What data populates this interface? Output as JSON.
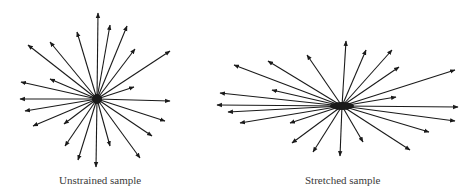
{
  "figure": {
    "panels": [
      {
        "id": "unstrained",
        "caption": "Unstrained sample",
        "center": [
          97,
          99
        ],
        "center_blob": {
          "rx": 5,
          "ry": 5
        },
        "arrows": [
          [
            98,
            13
          ],
          [
            110,
            25
          ],
          [
            127,
            26
          ],
          [
            77,
            32
          ],
          [
            50,
            42
          ],
          [
            135,
            49
          ],
          [
            28,
            45
          ],
          [
            170,
            51
          ],
          [
            21,
            82
          ],
          [
            50,
            79
          ],
          [
            134,
            87
          ],
          [
            20,
            99
          ],
          [
            170,
            101
          ],
          [
            25,
            111
          ],
          [
            33,
            126
          ],
          [
            64,
            124
          ],
          [
            165,
            121
          ],
          [
            152,
            136
          ],
          [
            65,
            146
          ],
          [
            78,
            160
          ],
          [
            96,
            167
          ],
          [
            110,
            146
          ],
          [
            140,
            158
          ]
        ]
      },
      {
        "id": "stretched",
        "caption": "Stretched sample",
        "center": [
          342,
          106
        ],
        "center_blob": {
          "rx": 12,
          "ry": 4
        },
        "arrows": [
          [
            346,
            41
          ],
          [
            366,
            50
          ],
          [
            392,
            50
          ],
          [
            307,
            55
          ],
          [
            268,
            61
          ],
          [
            234,
            65
          ],
          [
            399,
            67
          ],
          [
            455,
            70
          ],
          [
            272,
            90
          ],
          [
            220,
            93
          ],
          [
            396,
            97
          ],
          [
            217,
            105
          ],
          [
            228,
            112
          ],
          [
            458,
            107
          ],
          [
            240,
            123
          ],
          [
            290,
            123
          ],
          [
            455,
            121
          ],
          [
            429,
            132
          ],
          [
            292,
            143
          ],
          [
            313,
            152
          ],
          [
            340,
            156
          ],
          [
            363,
            142
          ],
          [
            410,
            150
          ]
        ]
      }
    ],
    "colors": {
      "line": "#1a1a1a",
      "caption": "#3a3a3a",
      "background": "#ffffff"
    }
  }
}
